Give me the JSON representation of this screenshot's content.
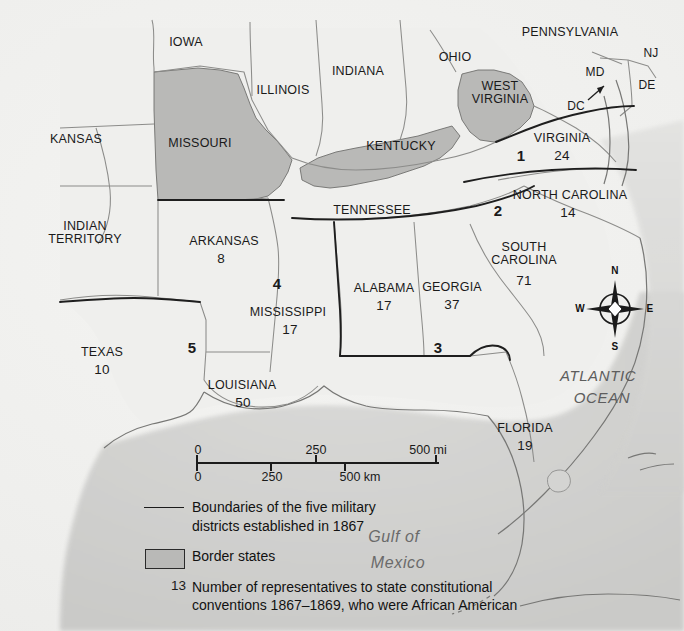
{
  "map": {
    "title": "Reconstruction military districts map",
    "states": [
      {
        "name": "IOWA",
        "x": 186,
        "y": 43,
        "size": "sm",
        "num": null
      },
      {
        "name": "ILLINOIS",
        "x": 283,
        "y": 91,
        "size": "sm",
        "num": null
      },
      {
        "name": "INDIANA",
        "x": 358,
        "y": 72,
        "size": "sm",
        "num": null
      },
      {
        "name": "OHIO",
        "x": 455,
        "y": 58,
        "size": "sm",
        "num": null
      },
      {
        "name": "PENNSYLVANIA",
        "x": 570,
        "y": 33,
        "size": "sm",
        "num": null
      },
      {
        "name": "NJ",
        "x": 651,
        "y": 53,
        "size": "tiny",
        "num": null
      },
      {
        "name": "MD",
        "x": 595,
        "y": 72,
        "size": "tiny",
        "num": null
      },
      {
        "name": "DE",
        "x": 647,
        "y": 85,
        "size": "tiny",
        "num": null
      },
      {
        "name": "DC",
        "x": 576,
        "y": 106,
        "size": "tiny",
        "num": null
      },
      {
        "name": "KANSAS",
        "x": 76,
        "y": 140,
        "size": "sm",
        "num": null
      },
      {
        "name": "MISSOURI",
        "x": 200,
        "y": 144,
        "size": "sm",
        "num": null
      },
      {
        "name": "KENTUCKY",
        "x": 401,
        "y": 147,
        "size": "sm",
        "num": null
      },
      {
        "name": "WEST\nVIRGINIA",
        "x": 500,
        "y": 93,
        "size": "sm",
        "num": null
      },
      {
        "name": "VIRGINIA",
        "x": 562,
        "y": 139,
        "size": "sm",
        "num": "24",
        "numx": 562,
        "numy": 156
      },
      {
        "name": "NORTH CAROLINA",
        "x": 570,
        "y": 196,
        "size": "sm",
        "num": "14",
        "numx": 568,
        "numy": 213
      },
      {
        "name": "TENNESSEE",
        "x": 372,
        "y": 211,
        "size": "sm",
        "num": null
      },
      {
        "name": "INDIAN\nTERRITORY",
        "x": 85,
        "y": 233,
        "size": "sm",
        "num": null
      },
      {
        "name": "ARKANSAS",
        "x": 224,
        "y": 242,
        "size": "sm",
        "num": "8",
        "numx": 221,
        "numy": 259
      },
      {
        "name": "SOUTH\nCAROLINA",
        "x": 524,
        "y": 254,
        "size": "sm",
        "num": "71",
        "numx": 524,
        "numy": 281
      },
      {
        "name": "ALABAMA",
        "x": 384,
        "y": 289,
        "size": "sm",
        "num": "17",
        "numx": 384,
        "numy": 306
      },
      {
        "name": "GEORGIA",
        "x": 452,
        "y": 288,
        "size": "sm",
        "num": "37",
        "numx": 452,
        "numy": 305
      },
      {
        "name": "MISSISSIPPI",
        "x": 288,
        "y": 313,
        "size": "sm",
        "num": "17",
        "numx": 290,
        "numy": 330
      },
      {
        "name": "TEXAS",
        "x": 102,
        "y": 353,
        "size": "sm",
        "num": "10",
        "numx": 102,
        "numy": 370
      },
      {
        "name": "LOUISIANA",
        "x": 242,
        "y": 386,
        "size": "sm",
        "num": "50",
        "numx": 243,
        "numy": 403
      },
      {
        "name": "FLORIDA",
        "x": 525,
        "y": 429,
        "size": "sm",
        "num": "19",
        "numx": 525,
        "numy": 446
      }
    ],
    "districts": [
      {
        "label": "1",
        "x": 521,
        "y": 156
      },
      {
        "label": "2",
        "x": 498,
        "y": 211
      },
      {
        "label": "3",
        "x": 438,
        "y": 348
      },
      {
        "label": "4",
        "x": 277,
        "y": 284
      },
      {
        "label": "5",
        "x": 192,
        "y": 348
      }
    ],
    "water_labels": [
      {
        "name": "ATLANTIC",
        "x": 598,
        "y": 376,
        "cls": "water"
      },
      {
        "name": "OCEAN",
        "x": 602,
        "y": 398,
        "cls": "water"
      },
      {
        "name": "Gulf of",
        "x": 394,
        "y": 537,
        "cls": "water gulf"
      },
      {
        "name": "Mexico",
        "x": 398,
        "y": 563,
        "cls": "water gulf"
      }
    ],
    "border_states": [
      "MISSOURI",
      "KENTUCKY",
      "WEST VIRGINIA"
    ],
    "colors": {
      "border_state_fill": "#b9b9b7",
      "land_fill": "#efefed",
      "ocean_fill": "#dcdcda",
      "boundary_line": "#2a2a2a",
      "state_line": "#8c8c8a",
      "text": "#1a1a1a"
    }
  },
  "compass": {
    "north": "N",
    "east": "E",
    "south": "S",
    "west": "W"
  },
  "scale": {
    "miles_labels": [
      "0",
      "250",
      "500 mi"
    ],
    "km_labels": [
      "0",
      "250",
      "500 km"
    ],
    "mi_positions": [
      0,
      50,
      100
    ],
    "km_positions": [
      0,
      31,
      62
    ]
  },
  "legend": {
    "rows": [
      {
        "key": "line",
        "number": null,
        "text": "Boundaries of the five military\ndistricts established in 1867"
      },
      {
        "key": "swatch",
        "number": null,
        "text": "Border states"
      },
      {
        "key": "number",
        "number": "13",
        "text": "Number of representatives to state constitutional\nconventions 1867–1869, who were African American"
      }
    ]
  }
}
